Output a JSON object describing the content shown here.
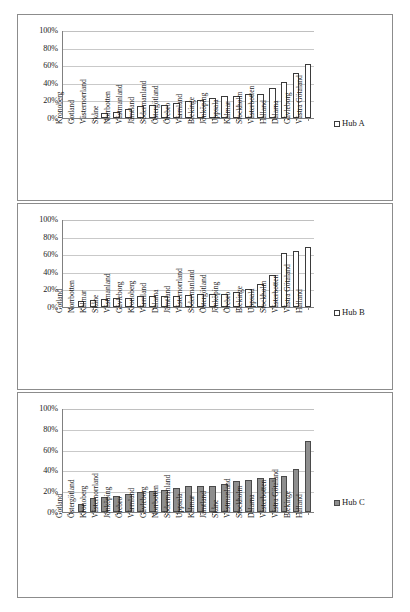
{
  "figure": {
    "panel_count": 3
  },
  "chart_data": [
    {
      "type": "bar",
      "title": "",
      "xlabel": "",
      "ylabel": "",
      "ylim": [
        0,
        100
      ],
      "yticks": [
        "0%",
        "20%",
        "40%",
        "60%",
        "80%",
        "100%"
      ],
      "ytick_values": [
        0,
        20,
        40,
        60,
        80,
        100
      ],
      "grid": true,
      "legend_position": "right",
      "legend": [
        "Hub A"
      ],
      "series_style": "hollow",
      "categories": [
        "Kronoberg",
        "Gotland",
        "Västernorrland",
        "Skåne",
        "Norrbotten",
        "Västmanland",
        "Jämtland",
        "Södermanland",
        "Östergötland",
        "Örebro",
        "Värmland",
        "Blekinge",
        "Jönköping",
        "Uppsala",
        "Kalmar",
        "Stockholm",
        "Västerbotten",
        "Halland",
        "Dalarna",
        "Gävleborg",
        "Västra Götaland"
      ],
      "values": [
        0,
        0,
        0,
        6,
        7,
        10,
        14,
        15,
        15,
        17,
        19,
        20,
        23,
        25,
        25,
        27,
        27,
        34,
        41,
        51,
        61
      ]
    },
    {
      "type": "bar",
      "title": "",
      "xlabel": "",
      "ylabel": "",
      "ylim": [
        0,
        100
      ],
      "yticks": [
        "0%",
        "20%",
        "40%",
        "60%",
        "80%",
        "100%"
      ],
      "ytick_values": [
        0,
        20,
        40,
        60,
        80,
        100
      ],
      "grid": true,
      "legend_position": "right",
      "legend": [
        "Hub B"
      ],
      "series_style": "hollow",
      "categories": [
        "Gotland",
        "Norrbotten",
        "Kalmar",
        "Skåne",
        "Västmanland",
        "Gävleborg",
        "Kronoberg",
        "Värmland",
        "Dalarna",
        "Jämtland",
        "Västernorrland",
        "Södermanland",
        "Östergötland",
        "Jönköping",
        "Örebro",
        "Blekinge",
        "Uppsala",
        "Stockholm",
        "Västerbotten",
        "Västra Götaland",
        "Halland"
      ],
      "values": [
        0,
        7,
        8,
        9,
        10,
        10,
        13,
        13,
        13,
        13,
        14,
        15,
        15,
        15,
        17,
        21,
        26,
        36,
        61,
        64,
        68
      ]
    },
    {
      "type": "bar",
      "title": "",
      "xlabel": "",
      "ylabel": "",
      "ylim": [
        0,
        100
      ],
      "yticks": [
        "0%",
        "20%",
        "40%",
        "60%",
        "80%",
        "100%"
      ],
      "ytick_values": [
        0,
        20,
        40,
        60,
        80,
        100
      ],
      "grid": true,
      "legend_position": "right",
      "legend": [
        "Hub C"
      ],
      "series_style": "filled",
      "categories": [
        "Gotland",
        "Östergötland",
        "Kronoberg",
        "Västernorrland",
        "Jönköping",
        "Örebro",
        "Värmland",
        "Gävleborg",
        "Norrbotten",
        "Södermanland",
        "Uppsala",
        "Kalmar",
        "Jämtland",
        "Skåne",
        "Västmanland",
        "Stockholm",
        "Dalarna",
        "Västerbotten",
        "Västra Götaland",
        "Blekinge",
        "Halland"
      ],
      "values": [
        0,
        8,
        13,
        14,
        15,
        17,
        19,
        20,
        21,
        23,
        25,
        25,
        25,
        27,
        30,
        31,
        33,
        33,
        35,
        41,
        68
      ]
    }
  ],
  "colors": {
    "bar_hollow_fill": "#ffffff",
    "bar_hollow_stroke": "#3b3b3b",
    "bar_filled_fill": "#8e8e8e",
    "bar_filled_stroke": "#4a4a4a",
    "gridline": "#c9c9c9",
    "axis": "#808080",
    "panel_border": "#8c8c8c",
    "text": "#1a1a1a"
  }
}
